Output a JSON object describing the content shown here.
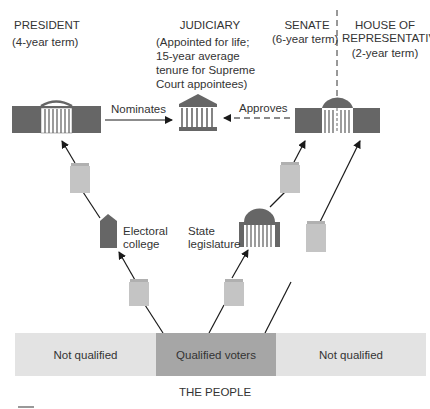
{
  "title_nodes": {
    "president": {
      "label": "PRESIDENT",
      "term": "(4-year term)"
    },
    "judiciary": {
      "label": "JUDICIARY",
      "term_lines": [
        "(Appointed for life;",
        "15-year average",
        "tenure for Supreme",
        "Court appointees)"
      ]
    },
    "senate": {
      "label": "SENATE",
      "term": "(6-year term)"
    },
    "house": {
      "label_lines": [
        "HOUSE OF",
        "REPRESENTATIVES"
      ],
      "term": "(2-year term)"
    }
  },
  "edges": {
    "nominates": "Nominates",
    "approves": "Approves"
  },
  "intermediaries": {
    "electoral_college": [
      "Electoral",
      "college"
    ],
    "state_legislature": [
      "State",
      "legislature"
    ]
  },
  "people": {
    "segments": [
      "Not qualified",
      "Qualified voters",
      "Not qualified"
    ],
    "caption": "THE PEOPLE"
  },
  "colors": {
    "building_dark": "#666666",
    "ballot": "#c4c4c4",
    "band_light": "#e3e3e3",
    "band_dark": "#a6a6a6",
    "line": "#1a1a1a"
  }
}
